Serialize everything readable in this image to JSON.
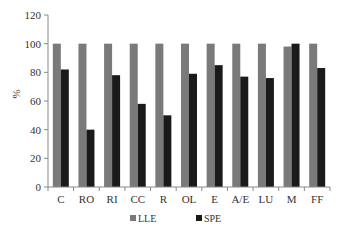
{
  "chart_data": {
    "type": "bar",
    "title": "",
    "xlabel": "",
    "ylabel": "%",
    "ylim": [
      0,
      120
    ],
    "yticks": [
      0,
      20,
      40,
      60,
      80,
      100,
      120
    ],
    "grid": false,
    "legend_position": "bottom",
    "categories": [
      "C",
      "RO",
      "RI",
      "CC",
      "R",
      "OL",
      "E",
      "A/E",
      "LU",
      "M",
      "FF"
    ],
    "series": [
      {
        "name": "LLE",
        "color": "#7a7a7a",
        "values": [
          100,
          100,
          100,
          100,
          100,
          100,
          100,
          100,
          100,
          98,
          100
        ]
      },
      {
        "name": "SPE",
        "color": "#1a1a1a",
        "values": [
          82,
          40,
          78,
          58,
          50,
          79,
          85,
          77,
          76,
          100,
          83
        ]
      }
    ]
  }
}
